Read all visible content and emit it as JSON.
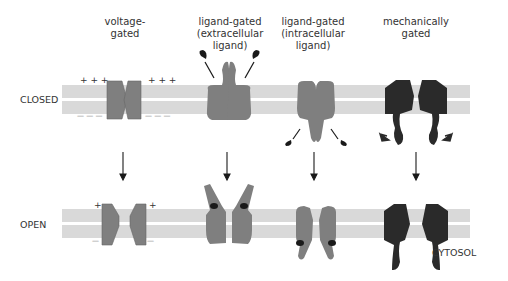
{
  "columns": [
    {
      "id": "voltage",
      "title": "voltage-\ngated",
      "line1": "voltage-",
      "line2": "gated",
      "line3": ""
    },
    {
      "id": "ligand-extra",
      "line1": "ligand-gated",
      "line2": "(extracellular",
      "line3": "ligand)"
    },
    {
      "id": "ligand-intra",
      "line1": "ligand-gated",
      "line2": "(intracellular",
      "line3": "ligand)"
    },
    {
      "id": "mechanical",
      "line1": "mechanically",
      "line2": "gated",
      "line3": ""
    }
  ],
  "rows": {
    "closed": "CLOSED",
    "open": "OPEN"
  },
  "cytosol_label": "CYTOSOL",
  "charges": {
    "plus_three": "+ + +",
    "minus_three": "— — —",
    "plus": "+",
    "minus": "—"
  },
  "colors": {
    "membrane": "#d9d9d9",
    "channel_gray": "#7f7f7f",
    "channel_dark": "#2a2a2a",
    "ligand": "#1a1a1a",
    "text": "#333333"
  }
}
